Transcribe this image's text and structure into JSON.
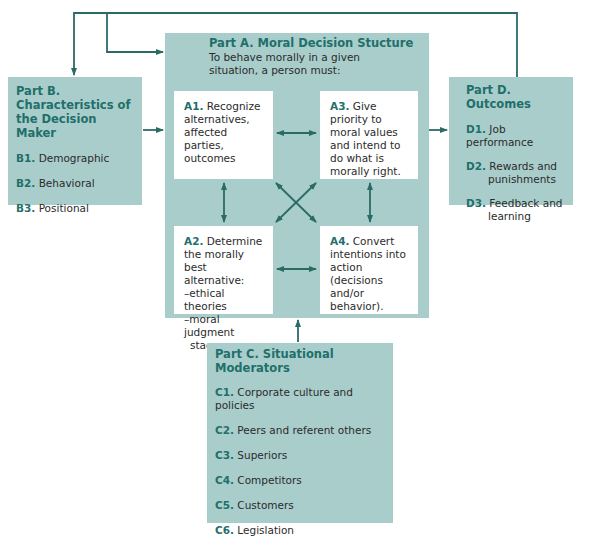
{
  "partA": {
    "title": "Part A. Moral Decision Stucture",
    "subtitle": "To behave morally in a given situation, a person must:",
    "a1": {
      "code": "A1.",
      "text": "Recognize alternatives, affected parties, outcomes"
    },
    "a2": {
      "code": "A2.",
      "text": "Determine the morally best alternative:",
      "bullets": [
        "–ethical theories",
        "–moral judgment",
        "  stages."
      ]
    },
    "a3": {
      "code": "A3.",
      "text": "Give priority to moral values and intend to do what is morally right."
    },
    "a4": {
      "code": "A4.",
      "text": "Convert intentions into action (decisions and/or behavior)."
    }
  },
  "partB": {
    "title": "Part B. Characteristics of the Decision Maker",
    "items": [
      {
        "code": "B1.",
        "text": "Demographic"
      },
      {
        "code": "B2.",
        "text": "Behavioral"
      },
      {
        "code": "B3.",
        "text": "Positional"
      }
    ]
  },
  "partC": {
    "title": "Part C. Situational Moderators",
    "items": [
      {
        "code": "C1.",
        "text": "Corporate culture and policies"
      },
      {
        "code": "C2.",
        "text": "Peers and referent others"
      },
      {
        "code": "C3.",
        "text": "Superiors"
      },
      {
        "code": "C4.",
        "text": "Competitors"
      },
      {
        "code": "C5.",
        "text": "Customers"
      },
      {
        "code": "C6.",
        "text": "Legislation"
      }
    ]
  },
  "partD": {
    "title": "Part D. Outcomes",
    "items": [
      {
        "code": "D1.",
        "text": "Job performance"
      },
      {
        "code": "D2.",
        "text": "Rewards and punishments"
      },
      {
        "code": "D3.",
        "text": "Feedback and learning"
      }
    ]
  },
  "colors": {
    "panel": "#a9cdcb",
    "accent": "#1f6f6a",
    "arrow": "#2a6b66"
  }
}
